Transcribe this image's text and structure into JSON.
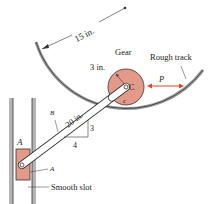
{
  "labels": {
    "radius_track": "15 in.",
    "gear": "Gear",
    "gear_radius": "3 in.",
    "point_c": "C",
    "contact": "c",
    "force": "P",
    "rough_track": "Rough track",
    "rod_length": "20 in.",
    "point_b": "B",
    "slope_rise": "3",
    "slope_run": "4",
    "point_a": "A",
    "slider": "A",
    "smooth_slot": "Smooth slot"
  },
  "colors": {
    "gear_fill": "#e39a88",
    "force_arrow": "#d9472f",
    "line": "#333333",
    "track_shade": "#9a9a9a"
  }
}
